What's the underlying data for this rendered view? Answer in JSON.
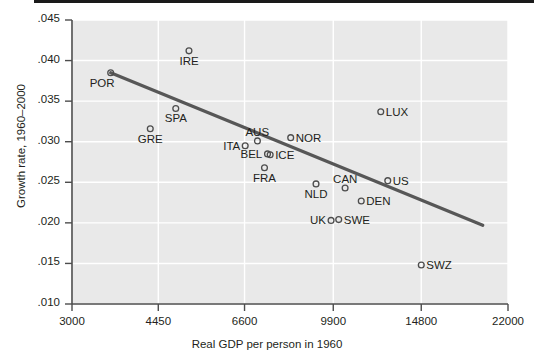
{
  "chart_data": {
    "type": "scatter",
    "title": "",
    "xlabel": "Real GDP per person in 1960",
    "ylabel": "Growth rate, 1960–2000",
    "xscale": "log",
    "xticks": [
      3000,
      4450,
      6600,
      9900,
      14800,
      22000
    ],
    "xticklabels": [
      "3000",
      "4450",
      "6600",
      "9900",
      "14800",
      "22000"
    ],
    "yticks": [
      0.01,
      0.015,
      0.02,
      0.025,
      0.03,
      0.035,
      0.04,
      0.045
    ],
    "yticklabels": [
      ".010",
      ".015",
      ".020",
      ".025",
      ".030",
      ".035",
      ".040",
      ".045"
    ],
    "xlim": [
      3000,
      22000
    ],
    "ylim": [
      0.01,
      0.045
    ],
    "grid": true,
    "grid_color": "#ffffff",
    "plot_background": "#e9e9e9",
    "marker_style": "open-circle",
    "marker_color": "#4d4d4d",
    "trendline": {
      "label": "fitted regression line",
      "color": "#575757",
      "x_start": 3580,
      "y_start": 0.0385,
      "x_end": 19600,
      "y_end": 0.0197
    },
    "points": [
      {
        "label": "POR",
        "x": 3580,
        "y": 0.0385,
        "label_pos": "below-left"
      },
      {
        "label": "IRE",
        "x": 5120,
        "y": 0.0412,
        "label_pos": "below"
      },
      {
        "label": "SPA",
        "x": 4820,
        "y": 0.0341,
        "label_pos": "below"
      },
      {
        "label": "GRE",
        "x": 4290,
        "y": 0.0316,
        "label_pos": "below"
      },
      {
        "label": "ITA",
        "x": 6620,
        "y": 0.0295,
        "label_pos": "left"
      },
      {
        "label": "AUS",
        "x": 7000,
        "y": 0.0301,
        "label_pos": "above"
      },
      {
        "label": "NOR",
        "x": 8150,
        "y": 0.0305,
        "label_pos": "right"
      },
      {
        "label": "BEL",
        "x": 7330,
        "y": 0.0285,
        "label_pos": "left"
      },
      {
        "label": "ICE",
        "x": 7420,
        "y": 0.0284,
        "label_pos": "right"
      },
      {
        "label": "FRA",
        "x": 7230,
        "y": 0.0268,
        "label_pos": "below"
      },
      {
        "label": "NLD",
        "x": 9150,
        "y": 0.0248,
        "label_pos": "below"
      },
      {
        "label": "CAN",
        "x": 10450,
        "y": 0.0243,
        "label_pos": "above"
      },
      {
        "label": "US",
        "x": 12700,
        "y": 0.0252,
        "label_pos": "right"
      },
      {
        "label": "DEN",
        "x": 11250,
        "y": 0.0227,
        "label_pos": "right"
      },
      {
        "label": "UK",
        "x": 9800,
        "y": 0.0203,
        "label_pos": "left"
      },
      {
        "label": "SWE",
        "x": 10150,
        "y": 0.0204,
        "label_pos": "right"
      },
      {
        "label": "LUX",
        "x": 12300,
        "y": 0.0337,
        "label_pos": "right"
      },
      {
        "label": "SWZ",
        "x": 14800,
        "y": 0.0148,
        "label_pos": "right"
      }
    ]
  }
}
